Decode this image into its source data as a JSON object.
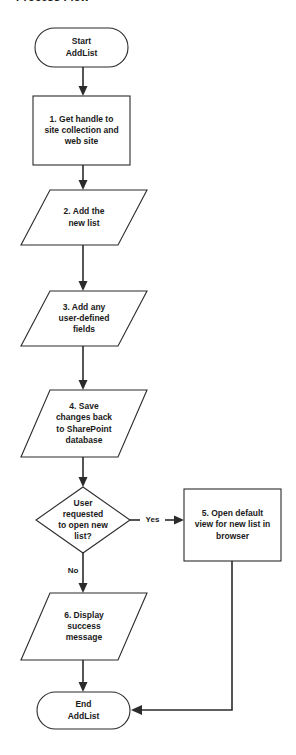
{
  "page": {
    "heading": "Process Flow"
  },
  "diagram": {
    "type": "flowchart",
    "orientation": "top-to-bottom",
    "nodes": [
      {
        "id": "start",
        "shape": "terminator",
        "label": "Start\nAddList"
      },
      {
        "id": "step1",
        "shape": "process",
        "label": "1. Get handle to\nsite collection and\nweb site"
      },
      {
        "id": "step2",
        "shape": "data",
        "label": "2. Add the\nnew list"
      },
      {
        "id": "step3",
        "shape": "data",
        "label": "3. Add any\nuser-defined\nfields"
      },
      {
        "id": "step4",
        "shape": "data",
        "label": "4. Save\nchanges back\nto SharePoint\ndatabase"
      },
      {
        "id": "decision",
        "shape": "decision",
        "label": "User\nrequested\nto open new\nlist?"
      },
      {
        "id": "step5",
        "shape": "process",
        "label": "5. Open default\nview for new list in\nbrowser"
      },
      {
        "id": "step6",
        "shape": "data",
        "label": "6. Display\nsuccess\nmessage"
      },
      {
        "id": "end",
        "shape": "terminator",
        "label": "End\nAddList"
      }
    ],
    "edges": [
      {
        "from": "start",
        "to": "step1",
        "label": ""
      },
      {
        "from": "step1",
        "to": "step2",
        "label": ""
      },
      {
        "from": "step2",
        "to": "step3",
        "label": ""
      },
      {
        "from": "step3",
        "to": "step4",
        "label": ""
      },
      {
        "from": "step4",
        "to": "decision",
        "label": ""
      },
      {
        "from": "decision",
        "to": "step5",
        "label": "Yes"
      },
      {
        "from": "decision",
        "to": "step6",
        "label": "No"
      },
      {
        "from": "step6",
        "to": "end",
        "label": ""
      },
      {
        "from": "step5",
        "to": "end",
        "label": ""
      }
    ],
    "labels": {
      "yes": "Yes",
      "no": "No"
    },
    "colors": {
      "stroke": "#2b2b2b",
      "fill": "#ffffff",
      "text": "#1a1a1a",
      "background": "#ffffff"
    }
  }
}
